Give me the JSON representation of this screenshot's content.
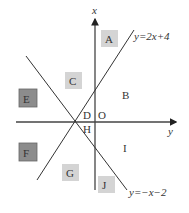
{
  "axes": {
    "vertical_label": "x",
    "horizontal_label": "y",
    "origin_label": "O"
  },
  "lines": [
    {
      "id": "line1",
      "equation": "y=2x+4"
    },
    {
      "id": "line2",
      "equation": "y=−x−2"
    }
  ],
  "regions": {
    "A": "A",
    "B": "B",
    "C": "C",
    "D": "D",
    "E": "E",
    "F": "F",
    "G": "G",
    "H": "H",
    "I": "I",
    "J": "J"
  },
  "colors": {
    "light_box": "#d4d4d4",
    "dark_box": "#8c8c8c",
    "line": "#333333"
  }
}
